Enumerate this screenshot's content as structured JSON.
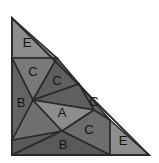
{
  "figure": {
    "name": "labelled-triangle-dissection",
    "canvas": {
      "width": 159,
      "height": 163,
      "background": "#ffffff"
    },
    "outline": {
      "name": "right-triangle-outline",
      "points": "12,18 12,155 149,155",
      "stroke": "#2a2a2a",
      "stroke_width": 1.6
    },
    "palette": {
      "light_gray": "#8d8d8d",
      "mid_gray": "#787878",
      "dark_gray": "#5e5e5e",
      "darker_gray": "#525252",
      "outline": "#2a2a2a",
      "label_color": "#141414"
    },
    "pieces": [
      {
        "id": "piece-e-top",
        "label": "E",
        "points": "12,18 57,58 12,58",
        "fill": "#8d8d8d",
        "label_x": 27,
        "label_y": 44
      },
      {
        "id": "piece-c-upper-left",
        "label": "C",
        "points": "12,58 57,58 33,100",
        "fill": "#797979",
        "label_x": 33,
        "label_y": 73
      },
      {
        "id": "piece-c-upper-right",
        "label": "C",
        "points": "57,58 79,84 33,100",
        "fill": "#5e5e5e",
        "label_x": 57,
        "label_y": 82
      },
      {
        "id": "piece-b-left",
        "label": "B",
        "points": "12,58 33,100 12,140",
        "fill": "#636363",
        "label_x": 21,
        "label_y": 104
      },
      {
        "id": "piece-a-center",
        "label": "A",
        "points": "33,100 94,110 62,131",
        "fill": "#8d8d8d",
        "label_x": 62,
        "label_y": 114
      },
      {
        "id": "piece-b-lower-left",
        "label": "",
        "points": "12,140 33,100 62,131",
        "fill": "#707070",
        "label_x": 0,
        "label_y": 0
      },
      {
        "id": "piece-c-right",
        "label": "C",
        "points": "79,84 110,120 94,110",
        "fill": "#636363",
        "label_x": 94,
        "label_y": 103
      },
      {
        "id": "piece-a-right-wedge",
        "label": "",
        "points": "33,100 79,84 94,110",
        "fill": "#5e5e5e",
        "label_x": 0,
        "label_y": 0
      },
      {
        "id": "piece-c-lower-right",
        "label": "C",
        "points": "62,131 94,110 110,120 110,155",
        "fill": "#6d6d6d",
        "label_x": 89,
        "label_y": 131
      },
      {
        "id": "piece-b-bottom",
        "label": "B",
        "points": "12,155 62,131 110,155",
        "fill": "#595959",
        "label_x": 63,
        "label_y": 146
      },
      {
        "id": "piece-b-bottom-left-fill",
        "label": "",
        "points": "12,140 62,131 12,155",
        "fill": "#5a5a5a",
        "label_x": 0,
        "label_y": 0
      },
      {
        "id": "piece-e-bottom-right",
        "label": "E",
        "points": "110,120 149,155 110,155",
        "fill": "#8d8d8d",
        "label_x": 123,
        "label_y": 142
      }
    ],
    "label_legend": [
      "E",
      "C",
      "C",
      "B",
      "A",
      "C",
      "C",
      "B",
      "E"
    ]
  }
}
